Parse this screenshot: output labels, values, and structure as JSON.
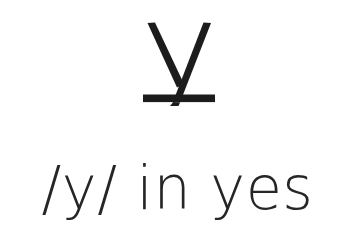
{
  "card": {
    "background_color": "#ffffff",
    "ink_color": "#1c1c1c",
    "text_color": "#262626"
  },
  "glyph": {
    "name": "y-with-stroke-glyph",
    "character": "ɏ",
    "description": "lowercase y with horizontal bar through descender",
    "alt_text": "y with stroke"
  },
  "label": {
    "text": "/y/ in yes",
    "phoneme": "/y/",
    "connector": "in",
    "example_word": "yes"
  }
}
